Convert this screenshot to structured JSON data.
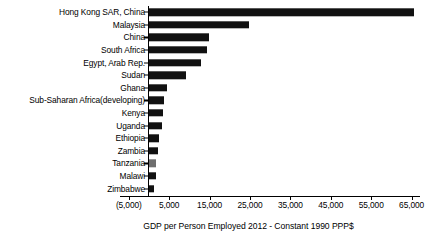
{
  "chart_data": {
    "type": "bar",
    "orientation": "horizontal",
    "title": "",
    "subtitle": "",
    "xlabel": "GDP per Person Employed 2012 - Constant 1990 PPP$",
    "ylabel": "",
    "xlim": [
      -5000,
      70000
    ],
    "grid": false,
    "legend": null,
    "xticks": [
      -5000,
      5000,
      15000,
      25000,
      35000,
      45000,
      55000,
      65000
    ],
    "xtick_labels": [
      "(5,000)",
      "5,000",
      "15,000",
      "25,000",
      "35,000",
      "45,000",
      "55,000",
      "65,000"
    ],
    "categories": [
      "Hong Kong SAR, China",
      "Malaysia",
      "China",
      "South Africa",
      "Egypt, Arab Rep.",
      "Sudan",
      "Ghana",
      "Sub-Saharan Africa(developing)",
      "Kenya",
      "Uganda",
      "Ethiopia",
      "Zambia",
      "Tanzania",
      "Malawi",
      "Zimbabwe"
    ],
    "values": [
      65600,
      24750,
      14900,
      14400,
      12800,
      9200,
      4550,
      3700,
      3400,
      3150,
      2400,
      2250,
      1700,
      1650,
      1300
    ],
    "bar_colors": [
      "#111111",
      "#111111",
      "#111111",
      "#111111",
      "#111111",
      "#111111",
      "#111111",
      "#111111",
      "#111111",
      "#111111",
      "#111111",
      "#111111",
      "#6e6e6e",
      "#111111",
      "#111111"
    ]
  },
  "axis": {
    "title": "GDP per Person Employed 2012 - Constant 1990 PPP$"
  }
}
